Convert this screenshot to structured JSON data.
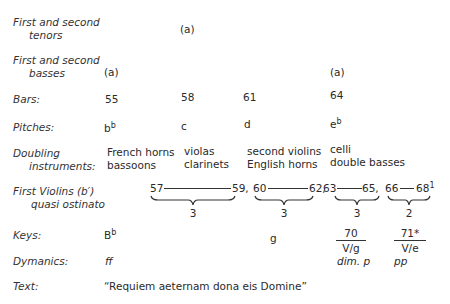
{
  "rows": {
    "tenors": {
      "label_line1": "First and second",
      "label_line2": "tenors",
      "marks": [
        "(a)"
      ]
    },
    "basses": {
      "label_line1": "First and second",
      "label_line2": "basses",
      "marks": [
        "(a)",
        "(a)"
      ]
    },
    "bars": {
      "label": "Bars:",
      "values": [
        "55",
        "58",
        "61",
        "64"
      ]
    },
    "pitches": {
      "label": "Pitches:",
      "values": [
        {
          "base": "b",
          "sup": "b"
        },
        {
          "base": "c",
          "sup": ""
        },
        {
          "base": "d",
          "sup": ""
        },
        {
          "base": "e",
          "sup": "b"
        }
      ]
    },
    "doubling": {
      "label_line1": "Doubling",
      "label_line2": "instruments:",
      "groups": [
        {
          "line1": "French horns",
          "line2": "bassoons"
        },
        {
          "line1": "violas",
          "line2": "clarinets"
        },
        {
          "line1": "second violins",
          "line2": "English horns"
        },
        {
          "line1": "celli",
          "line2": "double basses"
        }
      ]
    },
    "violins": {
      "label_line1": "First Violins (b′)",
      "label_line2": "quasi ostinato",
      "spans": [
        {
          "start": "57",
          "end": "59,",
          "count": "3"
        },
        {
          "start": "60",
          "end": "62,",
          "count": "3"
        },
        {
          "start": "63",
          "end": "65,",
          "count": "3"
        },
        {
          "start": "66",
          "end": "68",
          "end_sup": "1",
          "count": "2"
        }
      ]
    },
    "keys": {
      "label": "Keys:",
      "first": {
        "base": "B",
        "sup": "b"
      },
      "second": "g",
      "fractions": [
        {
          "num": "70",
          "den": "V/g"
        },
        {
          "num": "71*",
          "den": "V/e"
        }
      ]
    },
    "dynamics": {
      "label": "Dymanics:",
      "values": [
        "ff",
        "dim. p",
        "pp"
      ]
    },
    "text": {
      "label": "Text:",
      "value": "“Requiem aeternam dona eis Domine”"
    }
  }
}
